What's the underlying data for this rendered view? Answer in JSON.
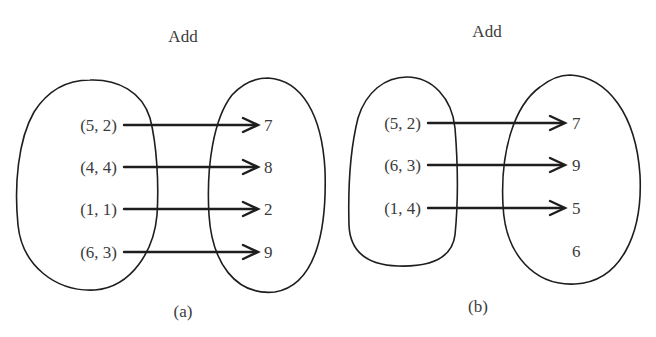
{
  "diagrams": [
    {
      "id": "a",
      "title": "Add",
      "caption": "(a)",
      "domain": [
        "(5, 2)",
        "(4, 4)",
        "(1, 1)",
        "(6, 3)"
      ],
      "codomain": [
        "7",
        "8",
        "2",
        "9"
      ],
      "mappings": [
        {
          "from": "(5, 2)",
          "to": "7"
        },
        {
          "from": "(4, 4)",
          "to": "8"
        },
        {
          "from": "(1, 1)",
          "to": "2"
        },
        {
          "from": "(6, 3)",
          "to": "9"
        }
      ]
    },
    {
      "id": "b",
      "title": "Add",
      "caption": "(b)",
      "domain": [
        "(5, 2)",
        "(6, 3)",
        "(1, 4)"
      ],
      "codomain": [
        "7",
        "9",
        "5",
        "6"
      ],
      "mappings": [
        {
          "from": "(5, 2)",
          "to": "7"
        },
        {
          "from": "(6, 3)",
          "to": "9"
        },
        {
          "from": "(1, 4)",
          "to": "5"
        }
      ]
    }
  ],
  "colors": {
    "line": "#1e1e1e",
    "text": "#3c3c3c",
    "background": "#ffffff"
  }
}
